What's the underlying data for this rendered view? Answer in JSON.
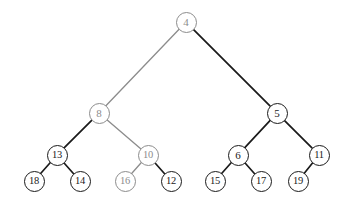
{
  "figure": {
    "kind": "binary-tree-diagram",
    "width": 349,
    "height": 208,
    "background": "#ffffff",
    "colors": {
      "dark": "#1a1a1a",
      "gray": "#8c8c8c"
    }
  },
  "chart_data": {
    "type": "diagram",
    "title": "",
    "nodes": [
      {
        "id": "n4",
        "label": "4",
        "x": 186,
        "y": 22,
        "r": 10.5,
        "color": "gray",
        "depth": 0
      },
      {
        "id": "n8",
        "label": "8",
        "x": 99,
        "y": 113,
        "r": 10.5,
        "color": "gray",
        "depth": 1
      },
      {
        "id": "n5",
        "label": "5",
        "x": 277,
        "y": 113,
        "r": 10.5,
        "color": "dark",
        "depth": 1
      },
      {
        "id": "n13",
        "label": "13",
        "x": 57,
        "y": 155,
        "r": 10.5,
        "color": "dark",
        "depth": 2
      },
      {
        "id": "n10",
        "label": "10",
        "x": 148,
        "y": 155,
        "r": 10.5,
        "color": "gray",
        "depth": 2
      },
      {
        "id": "n6",
        "label": "6",
        "x": 238,
        "y": 155,
        "r": 10.5,
        "color": "dark",
        "depth": 2
      },
      {
        "id": "n11",
        "label": "11",
        "x": 319,
        "y": 155,
        "r": 10.5,
        "color": "dark",
        "depth": 2
      },
      {
        "id": "n18",
        "label": "18",
        "x": 34,
        "y": 181,
        "r": 10.5,
        "color": "dark",
        "depth": 3
      },
      {
        "id": "n14",
        "label": "14",
        "x": 80,
        "y": 181,
        "r": 10.5,
        "color": "dark",
        "depth": 3
      },
      {
        "id": "n16",
        "label": "16",
        "x": 125,
        "y": 181,
        "r": 10.5,
        "color": "gray",
        "depth": 3
      },
      {
        "id": "n12",
        "label": "12",
        "x": 171,
        "y": 181,
        "r": 10.5,
        "color": "dark",
        "depth": 3
      },
      {
        "id": "n15",
        "label": "15",
        "x": 215,
        "y": 181,
        "r": 10.5,
        "color": "dark",
        "depth": 3
      },
      {
        "id": "n17",
        "label": "17",
        "x": 261,
        "y": 181,
        "r": 10.5,
        "color": "dark",
        "depth": 3
      },
      {
        "id": "n19",
        "label": "19",
        "x": 298,
        "y": 181,
        "r": 10.5,
        "color": "dark",
        "depth": 3
      }
    ],
    "edges": [
      {
        "from": "n4",
        "to": "n8",
        "color": "gray"
      },
      {
        "from": "n4",
        "to": "n5",
        "color": "dark"
      },
      {
        "from": "n8",
        "to": "n13",
        "color": "dark"
      },
      {
        "from": "n8",
        "to": "n10",
        "color": "gray"
      },
      {
        "from": "n5",
        "to": "n6",
        "color": "dark"
      },
      {
        "from": "n5",
        "to": "n11",
        "color": "dark"
      },
      {
        "from": "n13",
        "to": "n18",
        "color": "dark"
      },
      {
        "from": "n13",
        "to": "n14",
        "color": "dark"
      },
      {
        "from": "n10",
        "to": "n16",
        "color": "gray"
      },
      {
        "from": "n10",
        "to": "n12",
        "color": "dark"
      },
      {
        "from": "n6",
        "to": "n15",
        "color": "dark"
      },
      {
        "from": "n6",
        "to": "n17",
        "color": "dark"
      },
      {
        "from": "n11",
        "to": "n19",
        "color": "dark"
      }
    ]
  }
}
